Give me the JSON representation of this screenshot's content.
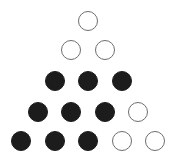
{
  "diagram": {
    "type": "triangular dot arrangement",
    "colors": {
      "filled": "#1c1c1c",
      "hollow_stroke": "#6e6e6e",
      "background": "#ffffff"
    },
    "rows": [
      {
        "row": 1,
        "dots": [
          "hollow"
        ]
      },
      {
        "row": 2,
        "dots": [
          "hollow",
          "hollow"
        ]
      },
      {
        "row": 3,
        "dots": [
          "filled",
          "filled",
          "filled"
        ]
      },
      {
        "row": 4,
        "dots": [
          "filled",
          "filled",
          "filled",
          "hollow"
        ]
      },
      {
        "row": 5,
        "dots": [
          "filled",
          "filled",
          "filled",
          "hollow",
          "hollow"
        ]
      }
    ],
    "counts": {
      "filled": 9,
      "hollow": 6,
      "total": 15
    }
  }
}
